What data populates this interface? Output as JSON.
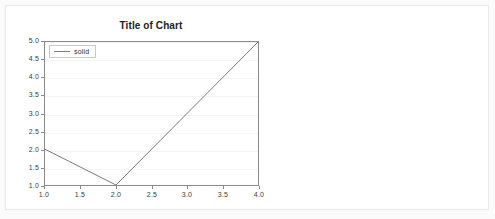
{
  "card": {
    "background": "#ffffff",
    "border_color": "#e9eaec"
  },
  "chart_data": {
    "type": "line",
    "title": "Title of Chart",
    "xlabel": "",
    "ylabel": "",
    "xlim": [
      1.0,
      4.0
    ],
    "ylim": [
      1.0,
      5.0
    ],
    "grid": true,
    "grid_axis": "y",
    "legend": {
      "position": "upper left",
      "entries": [
        {
          "label": "solid",
          "linestyle": "solid",
          "color": "#7a7a7a"
        }
      ]
    },
    "xticks": [
      "1.0",
      "1.5",
      "2.0",
      "2.5",
      "3.0",
      "3.5",
      "4.0"
    ],
    "xtick_values": [
      1.0,
      1.5,
      2.0,
      2.5,
      3.0,
      3.5,
      4.0
    ],
    "yticks": [
      "1.0",
      "1.5",
      "2.0",
      "2.5",
      "3.0",
      "3.5",
      "4.0",
      "4.5",
      "5.0"
    ],
    "ytick_values": [
      1.0,
      1.5,
      2.0,
      2.5,
      3.0,
      3.5,
      4.0,
      4.5,
      5.0
    ],
    "series": [
      {
        "name": "solid",
        "color": "#7a7a7a",
        "linestyle": "solid",
        "linewidth": 1,
        "x": [
          1.0,
          2.0,
          4.0
        ],
        "y": [
          2.0,
          1.0,
          5.0
        ]
      }
    ]
  }
}
